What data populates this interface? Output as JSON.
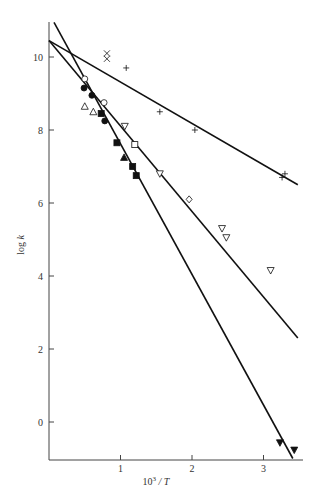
{
  "chart_data": {
    "type": "scatter",
    "title": "",
    "xlabel": "10³ / T",
    "ylabel": "log k",
    "xlim": [
      0,
      3.5
    ],
    "ylim": [
      -1.05,
      11
    ],
    "xticks": [
      1,
      2,
      3
    ],
    "yticks": [
      0,
      2,
      4,
      6,
      8,
      10
    ],
    "grid": false,
    "legend": null,
    "fit_lines": [
      {
        "name": "line-shallow",
        "x": [
          0.0,
          3.48
        ],
        "y": [
          10.45,
          6.5
        ]
      },
      {
        "name": "line-middle",
        "x": [
          0.0,
          3.48
        ],
        "y": [
          10.45,
          2.3
        ]
      },
      {
        "name": "line-steep",
        "x": [
          0.07,
          3.41
        ],
        "y": [
          10.95,
          -1.0
        ]
      }
    ],
    "series": [
      {
        "name": "cross-x",
        "marker": "x",
        "fill": "open",
        "points": [
          [
            0.81,
            10.1
          ],
          [
            0.81,
            9.95
          ]
        ]
      },
      {
        "name": "plus",
        "marker": "+",
        "fill": "open",
        "points": [
          [
            1.08,
            9.7
          ],
          [
            1.55,
            8.5
          ],
          [
            2.04,
            8.0
          ],
          [
            3.26,
            6.7
          ],
          [
            3.3,
            6.8
          ]
        ]
      },
      {
        "name": "open-circle",
        "marker": "circle",
        "fill": "open",
        "points": [
          [
            0.5,
            9.4
          ],
          [
            0.77,
            8.75
          ]
        ]
      },
      {
        "name": "open-triangle-up",
        "marker": "triangle-up",
        "fill": "open",
        "points": [
          [
            0.5,
            8.65
          ],
          [
            0.62,
            8.5
          ]
        ]
      },
      {
        "name": "open-triangle-down",
        "marker": "triangle-down",
        "fill": "open",
        "points": [
          [
            1.06,
            8.1
          ],
          [
            1.55,
            6.8
          ],
          [
            2.42,
            5.3
          ],
          [
            2.48,
            5.05
          ],
          [
            3.1,
            4.15
          ]
        ]
      },
      {
        "name": "open-square",
        "marker": "square",
        "fill": "open",
        "points": [
          [
            1.2,
            7.6
          ]
        ]
      },
      {
        "name": "open-diamond",
        "marker": "diamond",
        "fill": "open",
        "points": [
          [
            1.96,
            6.1
          ]
        ]
      },
      {
        "name": "filled-circle",
        "marker": "circle",
        "fill": "filled",
        "points": [
          [
            0.49,
            9.15
          ],
          [
            0.6,
            8.95
          ],
          [
            0.78,
            8.25
          ]
        ]
      },
      {
        "name": "filled-square",
        "marker": "square",
        "fill": "filled",
        "points": [
          [
            0.73,
            8.45
          ],
          [
            0.95,
            7.65
          ],
          [
            1.17,
            7.0
          ],
          [
            1.22,
            6.75
          ]
        ]
      },
      {
        "name": "filled-triangle-up",
        "marker": "triangle-up",
        "fill": "filled",
        "points": [
          [
            1.05,
            7.25
          ]
        ]
      },
      {
        "name": "filled-triangle-down",
        "marker": "triangle-down",
        "fill": "filled",
        "points": [
          [
            3.23,
            -0.57
          ],
          [
            3.43,
            -0.77
          ]
        ]
      }
    ]
  },
  "labels": {
    "xlabel_base": "10",
    "xlabel_sup": "3",
    "xlabel_tail": " / T",
    "ylabel_main": "log ",
    "ylabel_italic": "k"
  },
  "colors": {
    "ink": "#111111",
    "axis": "#444444",
    "background": "#ffffff"
  }
}
